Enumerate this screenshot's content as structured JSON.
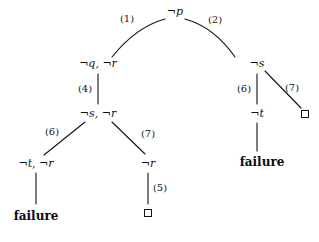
{
  "diagram": {
    "stroke_color": "#111111",
    "background_color": "#ffffff",
    "nodes": [
      {
        "id": "root",
        "label": "¬p",
        "x": 175,
        "y": 11,
        "kind": "goal"
      },
      {
        "id": "l1",
        "label": "¬q, ¬r",
        "x": 98,
        "y": 63,
        "kind": "goal"
      },
      {
        "id": "l2",
        "label": "¬s, ¬r",
        "x": 98,
        "y": 113,
        "kind": "goal"
      },
      {
        "id": "l3",
        "label": "¬t, ¬r",
        "x": 36,
        "y": 163,
        "kind": "goal"
      },
      {
        "id": "l4",
        "label": "¬r",
        "x": 148,
        "y": 163,
        "kind": "goal"
      },
      {
        "id": "r1",
        "label": "¬s",
        "x": 257,
        "y": 63,
        "kind": "goal"
      },
      {
        "id": "r2",
        "label": "¬t",
        "x": 257,
        "y": 113,
        "kind": "goal"
      }
    ],
    "failure_leaves": [
      {
        "id": "fail-left",
        "label": "failure",
        "x": 36,
        "y": 216
      },
      {
        "id": "fail-right",
        "label": "failure",
        "x": 262,
        "y": 162
      }
    ],
    "empty_clauses": [
      {
        "id": "box-left",
        "x": 148,
        "y": 213
      },
      {
        "id": "box-right",
        "x": 305,
        "y": 114
      }
    ],
    "edge_labels": [
      {
        "id": "e1",
        "label": "(1)",
        "x": 127,
        "y": 19
      },
      {
        "id": "e2",
        "label": "(2)",
        "x": 215,
        "y": 20
      },
      {
        "id": "e4",
        "label": "(4)",
        "x": 85,
        "y": 89
      },
      {
        "id": "e6l",
        "label": "(6)",
        "x": 52,
        "y": 132
      },
      {
        "id": "e7l",
        "label": "(7)",
        "x": 148,
        "y": 134
      },
      {
        "id": "e6r",
        "label": "(6)",
        "x": 244,
        "y": 89
      },
      {
        "id": "e7r",
        "label": "(7)",
        "x": 292,
        "y": 88
      },
      {
        "id": "e5",
        "label": "(5)",
        "x": 160,
        "y": 188
      }
    ],
    "edges": [
      {
        "id": "root-to-l1",
        "type": "curve",
        "from": "root",
        "to": "l1",
        "path": "M 165 19 Q 135 28 112 57"
      },
      {
        "id": "root-to-r1",
        "type": "curve",
        "from": "root",
        "to": "r1",
        "path": "M 185 19 Q 213 27 235 57"
      },
      {
        "id": "l1-to-l2",
        "type": "line",
        "from": "l1",
        "to": "l2",
        "path": "M 98 73 L 98 104"
      },
      {
        "id": "l2-to-l3",
        "type": "line",
        "from": "l2",
        "to": "l3",
        "path": "M 85 122 L 44 155"
      },
      {
        "id": "l2-to-l4",
        "type": "line",
        "from": "l2",
        "to": "l4",
        "path": "M 112 122 L 145 154"
      },
      {
        "id": "l3-to-fail",
        "type": "line",
        "from": "l3",
        "to": "fail-left",
        "path": "M 36 173 L 36 204"
      },
      {
        "id": "l4-to-box",
        "type": "line",
        "from": "l4",
        "to": "box-left",
        "path": "M 148 173 L 148 204"
      },
      {
        "id": "r1-to-r2",
        "type": "line",
        "from": "r1",
        "to": "r2",
        "path": "M 257 73 L 257 104"
      },
      {
        "id": "r1-to-box",
        "type": "line",
        "from": "r1",
        "to": "box-right",
        "path": "M 265 71 L 301 108"
      },
      {
        "id": "r2-to-fail",
        "type": "line",
        "from": "r2",
        "to": "fail-right",
        "path": "M 257 123 L 257 151"
      }
    ]
  }
}
